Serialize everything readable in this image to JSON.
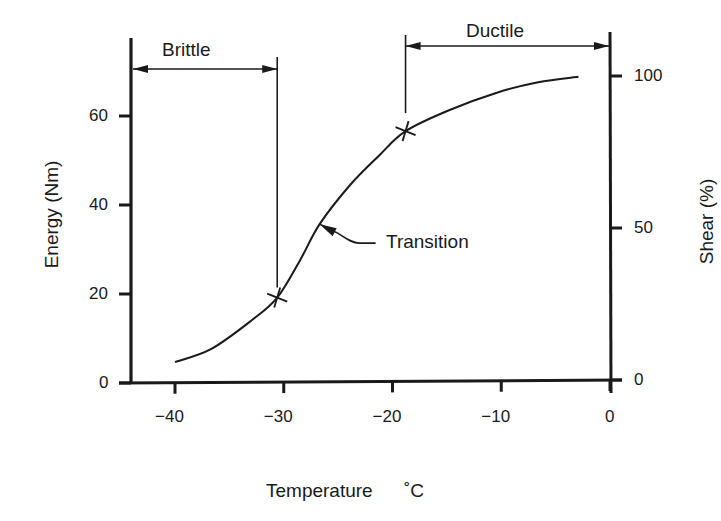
{
  "chart_data": {
    "type": "line",
    "title": "",
    "xlabel": "Temperature",
    "xunit": "°C",
    "ylabel": "Energy (Nm)",
    "y2label": "Shear (%)",
    "xlim": [
      -44,
      0
    ],
    "ylim": [
      0,
      72
    ],
    "y2lim": [
      0,
      100
    ],
    "grid": false,
    "legend": null,
    "x_ticks": [
      -40,
      -30,
      -20,
      -10,
      0
    ],
    "x_tick_labels": [
      "−40",
      "−30",
      "−20",
      "−10",
      "0"
    ],
    "y_ticks": [
      0,
      20,
      40,
      60
    ],
    "y_tick_labels": [
      "0",
      "20",
      "40",
      "60"
    ],
    "y2_ticks": [
      0,
      50,
      100
    ],
    "y2_tick_labels": [
      "0",
      "50",
      "100"
    ],
    "series": [
      {
        "name": "Impact energy curve",
        "x": [
          -40,
          -36.7,
          -33,
          -30.6,
          -28.5,
          -26.7,
          -23.9,
          -21.2,
          -18.8,
          -14.8,
          -10.2,
          -6.6,
          -2.9
        ],
        "y": [
          4.7,
          7.6,
          14,
          19.2,
          27.6,
          35.7,
          44.5,
          51.2,
          56.6,
          61.3,
          65.4,
          67.6,
          68.8
        ]
      }
    ],
    "markers": [
      {
        "name": "brittle-limit",
        "x": -30.6,
        "y": 19.2,
        "symbol": "x"
      },
      {
        "name": "ductile-limit",
        "x": -18.8,
        "y": 56.6,
        "symbol": "x"
      }
    ],
    "annotations": [
      {
        "text": "Brittle",
        "type": "range-arrow",
        "x_from": -44,
        "x_to": -30.6
      },
      {
        "text": "Ductile",
        "type": "range-arrow",
        "x_from": -18.8,
        "x_to": 0
      },
      {
        "text": "Transition",
        "type": "pointer",
        "x": -26.7,
        "y": 35.7
      }
    ]
  },
  "labels": {
    "xlabel": "Temperature",
    "xunit": "˚C",
    "ylabel": "Energy (Nm)",
    "y2label": "Shear (%)",
    "brittle": "Brittle",
    "ductile": "Ductile",
    "transition": "Transition"
  },
  "colors": {
    "ink": "#1a1a1a",
    "background": "#ffffff"
  }
}
